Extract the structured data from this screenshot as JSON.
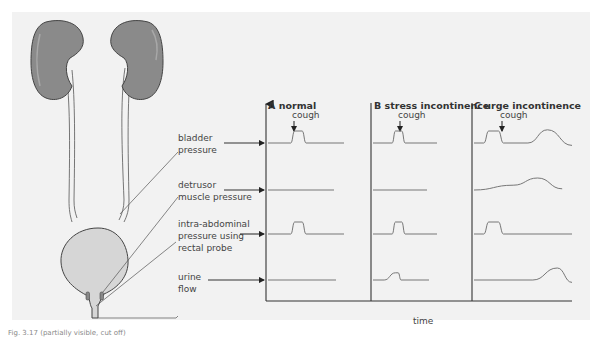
{
  "figure": {
    "caption": "Fig. 3.17 (partially visible, cut off)",
    "panel_background": "#f2f2f2"
  },
  "anatomy": {
    "structures": [
      "left kidney",
      "right kidney",
      "left ureter",
      "right ureter",
      "bladder",
      "urethra"
    ],
    "kidney_color": "#8a8a8a",
    "bladder_color": "#d6d6d6"
  },
  "labels": {
    "bladder_pressure": [
      "bladder",
      "pressure"
    ],
    "detrusor_pressure": [
      "detrusor",
      "muscle pressure"
    ],
    "intra_abdominal_pressure": [
      "intra-abdominal",
      "pressure using",
      "rectal probe"
    ],
    "urine_flow": [
      "urine",
      "flow"
    ]
  },
  "chart_data": {
    "type": "line",
    "xlabel": "time",
    "ylabel": "",
    "columns": [
      "A normal",
      "B stress incontinence",
      "C urge incontinence"
    ],
    "rows": [
      "bladder pressure",
      "detrusor muscle pressure",
      "intra-abdominal pressure using rectal probe",
      "urine flow"
    ],
    "event_label": "cough",
    "traces": {
      "A normal": {
        "bladder pressure": "brief spike at cough",
        "detrusor muscle pressure": "flat",
        "intra-abdominal pressure": "brief spike at cough",
        "urine flow": "flat (no leakage)"
      },
      "B stress incontinence": {
        "bladder pressure": "brief spike at cough",
        "detrusor muscle pressure": "flat",
        "intra-abdominal pressure": "brief spike at cough",
        "urine flow": "small bump coinciding with cough (leakage)"
      },
      "C urge incontinence": {
        "bladder pressure": "cough spike followed by later broad rise",
        "detrusor muscle pressure": "gradual broad rise (involuntary contraction)",
        "intra-abdominal pressure": "brief spike at cough only",
        "urine flow": "broad rise coinciding with detrusor contraction"
      }
    },
    "series": [
      {
        "name": "A bladder pressure",
        "x": [
          0,
          0.3,
          0.35,
          0.45,
          0.5,
          1
        ],
        "y": [
          0,
          0,
          1,
          1,
          0,
          0
        ]
      },
      {
        "name": "A detrusor pressure",
        "x": [
          0,
          1
        ],
        "y": [
          0,
          0
        ]
      },
      {
        "name": "A intra-abdominal pressure",
        "x": [
          0,
          0.3,
          0.35,
          0.45,
          0.5,
          1
        ],
        "y": [
          0,
          0,
          1,
          1,
          0,
          0
        ]
      },
      {
        "name": "A urine flow",
        "x": [
          0,
          1
        ],
        "y": [
          0,
          0
        ]
      },
      {
        "name": "B bladder pressure",
        "x": [
          0,
          0.3,
          0.35,
          0.45,
          0.5,
          1
        ],
        "y": [
          0,
          0,
          1,
          1,
          0,
          0
        ]
      },
      {
        "name": "B detrusor pressure",
        "x": [
          0,
          1
        ],
        "y": [
          0,
          0
        ]
      },
      {
        "name": "B intra-abdominal pressure",
        "x": [
          0,
          0.3,
          0.35,
          0.45,
          0.5,
          1
        ],
        "y": [
          0,
          0,
          1,
          1,
          0,
          0
        ]
      },
      {
        "name": "B urine flow",
        "x": [
          0,
          0.2,
          0.4,
          0.45,
          0.5,
          1
        ],
        "y": [
          0,
          0,
          0.6,
          0.6,
          0,
          0
        ]
      },
      {
        "name": "C bladder pressure",
        "x": [
          0,
          0.1,
          0.15,
          0.25,
          0.3,
          0.55,
          0.75,
          1
        ],
        "y": [
          0,
          0,
          1,
          1,
          0,
          0,
          1.1,
          -0.2
        ]
      },
      {
        "name": "C detrusor pressure",
        "x": [
          0,
          0.4,
          0.65,
          0.9
        ],
        "y": [
          0,
          0.4,
          1.0,
          0.1
        ]
      },
      {
        "name": "C intra-abdominal pressure",
        "x": [
          0,
          0.1,
          0.15,
          0.25,
          0.3,
          1
        ],
        "y": [
          0,
          0,
          1,
          1,
          0,
          0
        ]
      },
      {
        "name": "C urine flow",
        "x": [
          0,
          0.6,
          0.85,
          1
        ],
        "y": [
          0,
          0,
          1.0,
          -0.2
        ]
      }
    ],
    "grid": false,
    "legend": "none"
  }
}
